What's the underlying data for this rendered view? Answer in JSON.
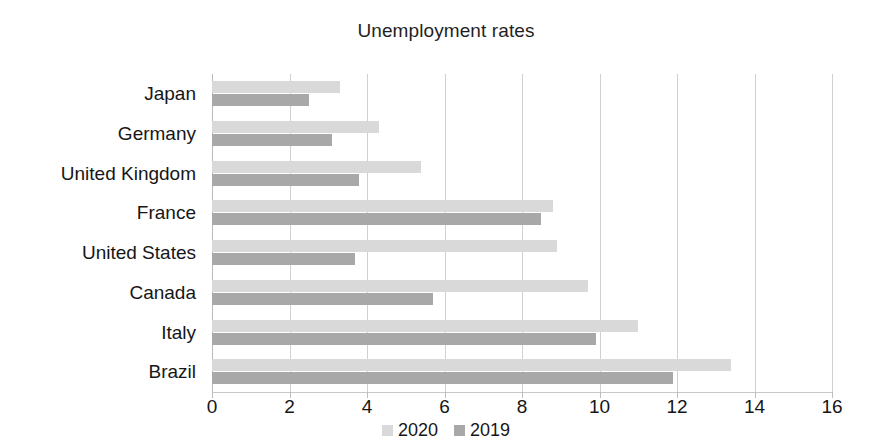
{
  "chart_data": {
    "type": "bar",
    "orientation": "horizontal",
    "title": "Unemployment rates",
    "xlabel": "",
    "ylabel": "",
    "xlim": [
      0,
      16
    ],
    "xticks": [
      0,
      2,
      4,
      6,
      8,
      10,
      12,
      14,
      16
    ],
    "xtick_labels": [
      "0",
      "2",
      "4",
      "6",
      "8",
      "10",
      "12",
      "14",
      "16"
    ],
    "grid": true,
    "grid_axis": "x",
    "legend_position": "bottom-center",
    "categories": [
      "Japan",
      "Germany",
      "United Kingdom",
      "France",
      "United States",
      "Canada",
      "Italy",
      "Brazil"
    ],
    "series": [
      {
        "name": "2020",
        "color": "#d9d9d9",
        "values": [
          3.3,
          4.3,
          5.4,
          8.8,
          8.9,
          9.7,
          11.0,
          13.4
        ]
      },
      {
        "name": "2019",
        "color": "#a8a8a8",
        "values": [
          2.5,
          3.1,
          3.8,
          8.5,
          3.7,
          5.7,
          9.9,
          11.9
        ]
      }
    ]
  }
}
